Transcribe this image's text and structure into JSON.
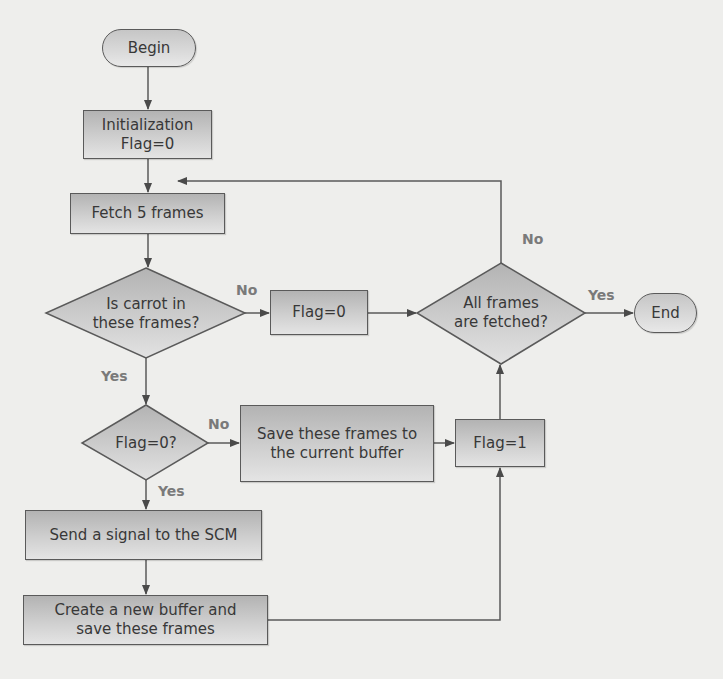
{
  "diagram": {
    "type": "flowchart",
    "colors": {
      "background": "#eeeeec",
      "node_fill_top": "#b3b3b3",
      "node_fill_bottom": "#e4e4e4",
      "stroke": "#5a5a5a",
      "text": "#383838",
      "edge_label": "#7a7a7a"
    },
    "nodes": {
      "begin": {
        "shape": "terminator",
        "label": "Begin"
      },
      "init": {
        "shape": "process",
        "line1": "Initialization",
        "line2": "Flag=0"
      },
      "fetch": {
        "shape": "process",
        "label": "Fetch 5 frames"
      },
      "carrot_decision": {
        "shape": "decision",
        "line1": "Is carrot in",
        "line2": "these frames?"
      },
      "flag0_set": {
        "shape": "process",
        "label": "Flag=0"
      },
      "all_fetched_decision": {
        "shape": "decision",
        "line1": "All frames",
        "line2": "are fetched?"
      },
      "end": {
        "shape": "terminator",
        "label": "End"
      },
      "flag0_decision": {
        "shape": "decision",
        "label": "Flag=0?"
      },
      "save_current": {
        "shape": "process",
        "line1": "Save these frames to",
        "line2": "the current buffer"
      },
      "flag1_set": {
        "shape": "process",
        "label": "Flag=1"
      },
      "send_signal": {
        "shape": "process",
        "label": "Send a signal to the SCM"
      },
      "create_buffer": {
        "shape": "process",
        "line1": "Create a new buffer and",
        "line2": "save these frames"
      }
    },
    "edge_labels": {
      "carrot_no": "No",
      "carrot_yes": "Yes",
      "all_fetched_no": "No",
      "all_fetched_yes": "Yes",
      "flag0_no": "No",
      "flag0_yes": "Yes"
    },
    "edges": [
      {
        "from": "begin",
        "to": "init",
        "label": ""
      },
      {
        "from": "init",
        "to": "fetch",
        "label": ""
      },
      {
        "from": "fetch",
        "to": "carrot_decision",
        "label": ""
      },
      {
        "from": "carrot_decision",
        "to": "flag0_set",
        "label": "No"
      },
      {
        "from": "flag0_set",
        "to": "all_fetched_decision",
        "label": ""
      },
      {
        "from": "all_fetched_decision",
        "to": "end",
        "label": "Yes"
      },
      {
        "from": "all_fetched_decision",
        "to": "fetch",
        "label": "No"
      },
      {
        "from": "carrot_decision",
        "to": "flag0_decision",
        "label": "Yes"
      },
      {
        "from": "flag0_decision",
        "to": "save_current",
        "label": "No"
      },
      {
        "from": "save_current",
        "to": "flag1_set",
        "label": ""
      },
      {
        "from": "flag0_decision",
        "to": "send_signal",
        "label": "Yes"
      },
      {
        "from": "send_signal",
        "to": "create_buffer",
        "label": ""
      },
      {
        "from": "create_buffer",
        "to": "flag1_set",
        "label": ""
      },
      {
        "from": "flag1_set",
        "to": "all_fetched_decision",
        "label": ""
      }
    ]
  }
}
